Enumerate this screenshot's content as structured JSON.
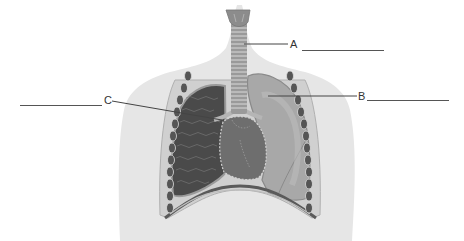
{
  "diagram": {
    "colors": {
      "background": "#ffffff",
      "body_silhouette": "#e6e6e6",
      "trachea": "#9a9a9a",
      "larynx": "#8c8c8c",
      "left_lung_tissue": "#4a4a4a",
      "right_lung": "#a8a8a8",
      "heart": "#6e6e6e",
      "diaphragm": "#5a5a5a",
      "ribs": "#555555",
      "pleura": "#c8c8c8",
      "leader_line": "#444444"
    },
    "labels": [
      {
        "id": "A",
        "text": "A",
        "points_to": "trachea"
      },
      {
        "id": "B",
        "text": "B",
        "points_to": "lung"
      },
      {
        "id": "C",
        "text": "C",
        "points_to": "bronchus"
      }
    ],
    "answer_blanks": [
      {
        "for": "A",
        "value": ""
      },
      {
        "for": "B",
        "value": ""
      },
      {
        "for": "C",
        "value": ""
      }
    ]
  }
}
